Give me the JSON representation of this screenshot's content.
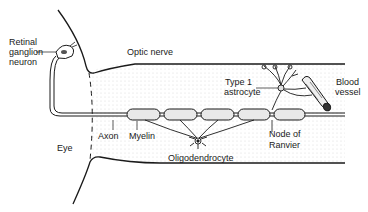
{
  "diagram": {
    "labels": {
      "retinal_ganglion_line1": "Retinal",
      "retinal_ganglion_line2": "ganglion",
      "retinal_ganglion_line3": "neuron",
      "optic_nerve": "Optic nerve",
      "type1_line1": "Type 1",
      "type1_line2": "astrocyte",
      "blood_line1": "Blood",
      "blood_line2": "vessel",
      "axon": "Axon",
      "myelin": "Myelin",
      "eye": "Eye",
      "oligodendrocyte": "Oligodendrocyte",
      "node_line1": "Node of",
      "node_line2": "Ranvier"
    },
    "colors": {
      "line": "#1a1a1a",
      "stipple": "#d6d6d6",
      "background": "#ffffff"
    }
  }
}
